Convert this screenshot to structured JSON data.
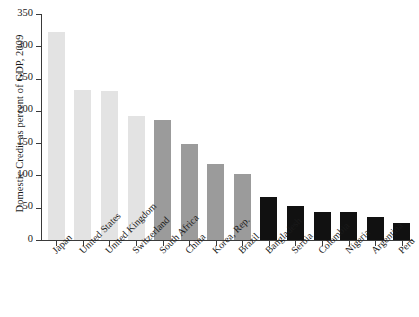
{
  "chart_data": {
    "type": "bar",
    "title": "",
    "subtitle": "",
    "xlabel": "",
    "ylabel": "Domestic Credit as percent of GDP, 2009",
    "ylim": [
      0,
      350
    ],
    "yticks": [
      0,
      50,
      100,
      150,
      200,
      250,
      300,
      350
    ],
    "ytick_labels": [
      "0",
      "50",
      "100",
      "150",
      "200",
      "250",
      "300",
      "350"
    ],
    "grid": false,
    "legend": "none",
    "categories": [
      "Japan",
      "United States",
      "United Kingdom",
      "Switzerland",
      "South Africa",
      "China",
      "Korea, Rep.",
      "Brazil",
      "Bangladesh",
      "Serbia",
      "Colombia",
      "Nigeria",
      "Argentina",
      "Peru"
    ],
    "values": [
      322,
      232,
      231,
      192,
      186,
      148,
      118,
      102,
      66,
      52,
      44,
      43,
      36,
      27
    ],
    "bar_colors": [
      "#e3e3e3",
      "#e3e3e3",
      "#e3e3e3",
      "#e3e3e3",
      "#9b9b9b",
      "#9b9b9b",
      "#9b9b9b",
      "#9b9b9b",
      "#111111",
      "#111111",
      "#111111",
      "#111111",
      "#111111",
      "#111111"
    ],
    "series": [
      {
        "name": "Domestic Credit as percent of GDP, 2009",
        "values": [
          322,
          232,
          231,
          192,
          186,
          148,
          118,
          102,
          66,
          52,
          44,
          43,
          36,
          27
        ]
      }
    ]
  },
  "axis": {
    "color": "#3a3a3a"
  }
}
